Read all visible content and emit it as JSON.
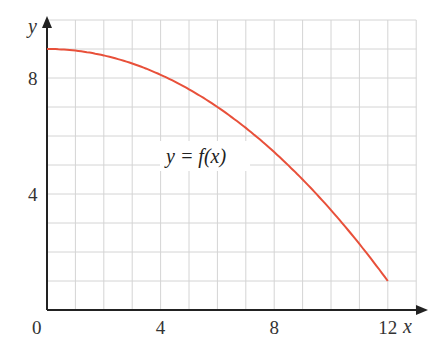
{
  "chart_data": {
    "type": "line",
    "title": "",
    "xlabel": "x",
    "ylabel": "y",
    "xlim": [
      0,
      13
    ],
    "ylim": [
      0,
      10
    ],
    "grid": true,
    "grid_step": 1,
    "x_ticks": [
      0,
      4,
      8,
      12
    ],
    "y_ticks": [
      4,
      8
    ],
    "x_tick_labels": [
      "0",
      "4",
      "8",
      "12"
    ],
    "y_tick_labels": [
      "4",
      "8"
    ],
    "annotation": "y = f(x)",
    "series": [
      {
        "name": "y = f(x)",
        "color": "#e8503a",
        "x": [
          0,
          1,
          2,
          3,
          4,
          5,
          6,
          7,
          8,
          9,
          10,
          11,
          12
        ],
        "values": [
          9.0,
          8.94,
          8.78,
          8.5,
          8.11,
          7.61,
          7.0,
          6.28,
          5.44,
          4.5,
          3.44,
          2.28,
          1.0
        ]
      }
    ]
  },
  "colors": {
    "grid": "#d4d4d4",
    "axis": "#222222",
    "curve": "#e8503a"
  }
}
